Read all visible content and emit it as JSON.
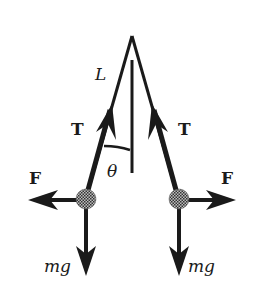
{
  "diagram": {
    "labels": {
      "length": "L",
      "tension_left": "T",
      "tension_right": "T",
      "angle": "θ",
      "force_left": "F",
      "force_right": "F",
      "weight_left": "mg",
      "weight_right": "mg"
    },
    "colors": {
      "ink": "#1a1a1a",
      "ball": "#6b6b6b",
      "background": "#ffffff"
    }
  }
}
